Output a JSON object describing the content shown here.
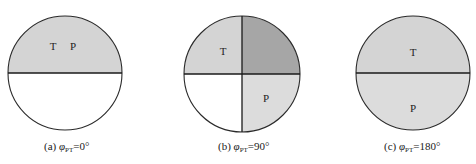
{
  "figure": {
    "colors": {
      "outline": "#2a2a2a",
      "light_gray": "#d4d4d4",
      "lighter_gray": "#dcdcdc",
      "dark_gray": "#a6a6a6",
      "white": "#ffffff"
    },
    "panels": [
      {
        "id": "a",
        "caption_prefix": "(a) ",
        "phi": "φ",
        "subscript": "PT",
        "caption_value": "=0°",
        "labels": {
          "T": "T",
          "P": "P"
        },
        "description": "Upper half gray (T and P overlap), lower half white"
      },
      {
        "id": "b",
        "caption_prefix": "(b) ",
        "phi": "φ",
        "subscript": "PT",
        "caption_value": "=90°",
        "labels": {
          "T": "T",
          "P": "P"
        },
        "description": "Top-left T light gray, top-right overlap dark gray, bottom-right P light gray, bottom-left white"
      },
      {
        "id": "c",
        "caption_prefix": "(c) ",
        "phi": "φ",
        "subscript": "PT",
        "caption_value": "=180°",
        "labels": {
          "T": "T",
          "P": "P"
        },
        "description": "Upper half T light gray, lower half P light gray"
      }
    ]
  }
}
